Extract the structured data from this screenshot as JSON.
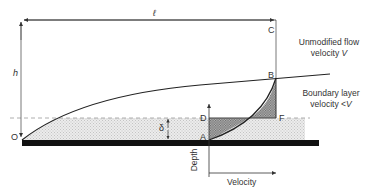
{
  "diagram": {
    "type": "boundary-layer-flow-diagram",
    "labels": {
      "length": "ℓ",
      "height": "h",
      "delta": "δ",
      "origin": "O",
      "point_a": "A",
      "point_b": "B",
      "point_c": "C",
      "point_d": "D",
      "point_f": "F",
      "depth_axis": "Depth",
      "velocity_axis": "Velocity"
    },
    "annotations": {
      "unmodified_line1": "Unmodified flow",
      "unmodified_line2_text": "velocity ",
      "unmodified_line2_var": "V",
      "boundary_line1": "Boundary layer",
      "boundary_line2_text": "velocity <",
      "boundary_line2_var": "V"
    },
    "colors": {
      "line": "#333333",
      "plate": "#111111",
      "stipple": "#d9d9d9",
      "hatch": "#8a8a8a"
    }
  }
}
